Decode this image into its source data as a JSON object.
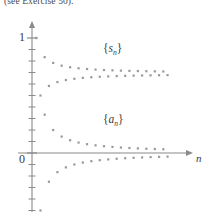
{
  "caption": {
    "text": "(see Exercise 50)."
  },
  "axes": {
    "y_tick_label": "1",
    "origin_label": "0",
    "x_axis_label": "n"
  },
  "labels": {
    "partial_sums": {
      "brace_open": "{",
      "symbol": "s",
      "subscript": "n",
      "brace_close": "}"
    },
    "terms": {
      "brace_open": "{",
      "symbol": "a",
      "subscript": "n",
      "brace_close": "}"
    }
  },
  "colors": {
    "axis": "#8a8a8a",
    "point": "#9a9a9a",
    "text": "#3a3a3a",
    "caption": "#4a4a4a",
    "background": "#ffffff"
  },
  "chart_data": {
    "type": "scatter",
    "title": "",
    "subtitle": "",
    "xlabel": "n",
    "ylabel": "",
    "grid": false,
    "legend_position": "inline-annotation",
    "xlim": [
      0,
      34
    ],
    "ylim": [
      -0.62,
      1.15
    ],
    "yticks": [
      -0.5,
      -0.4,
      -0.3,
      -0.2,
      -0.1,
      0,
      0.1,
      0.2,
      0.3,
      0.4,
      0.5,
      0.6,
      0.7,
      0.8,
      0.9,
      1.0
    ],
    "ytick_labels": [
      "",
      "",
      "",
      "",
      "",
      "0",
      "",
      "",
      "",
      "",
      "",
      "",
      "",
      "",
      "",
      "1"
    ],
    "annotations": [
      {
        "text": "{s_n}",
        "x": 16,
        "y": 0.95
      },
      {
        "text": "{a_n}",
        "x": 16,
        "y": 0.35
      }
    ],
    "series": [
      {
        "name": "{s_n}",
        "description": "Partial sums of the alternating harmonic series, converging to ln 2",
        "x": [
          1,
          2,
          3,
          4,
          5,
          6,
          7,
          8,
          9,
          10,
          11,
          12,
          13,
          14,
          15,
          16,
          17,
          18,
          19,
          20,
          21,
          22,
          23,
          24,
          25,
          26,
          27,
          28,
          29,
          30,
          31,
          32
        ],
        "values": [
          1.0,
          0.5,
          0.8333,
          0.5833,
          0.7833,
          0.6167,
          0.7595,
          0.6345,
          0.7456,
          0.6456,
          0.7365,
          0.6532,
          0.7302,
          0.6588,
          0.7254,
          0.6629,
          0.7216,
          0.6661,
          0.7187,
          0.6687,
          0.7163,
          0.6708,
          0.7143,
          0.6726,
          0.7126,
          0.6741,
          0.7111,
          0.6754,
          0.7099,
          0.6765,
          0.7088,
          0.6775
        ]
      },
      {
        "name": "{a_n}",
        "description": "Terms of the alternating harmonic series a_n = (-1)^(n+1)/n",
        "x": [
          1,
          2,
          3,
          4,
          5,
          6,
          7,
          8,
          9,
          10,
          11,
          12,
          13,
          14,
          15,
          16,
          17,
          18,
          19,
          20,
          21,
          22,
          23,
          24,
          25,
          26,
          27,
          28,
          29,
          30,
          31,
          32
        ],
        "values": [
          1.0,
          -0.5,
          0.3333,
          -0.25,
          0.2,
          -0.1667,
          0.1429,
          -0.125,
          0.1111,
          -0.1,
          0.0909,
          -0.0833,
          0.0769,
          -0.0714,
          0.0667,
          -0.0625,
          0.0588,
          -0.0556,
          0.0526,
          -0.05,
          0.0476,
          -0.0455,
          0.0435,
          -0.0417,
          0.04,
          -0.0385,
          0.037,
          -0.0357,
          0.0345,
          -0.0333,
          0.0323,
          -0.0313
        ]
      }
    ]
  }
}
